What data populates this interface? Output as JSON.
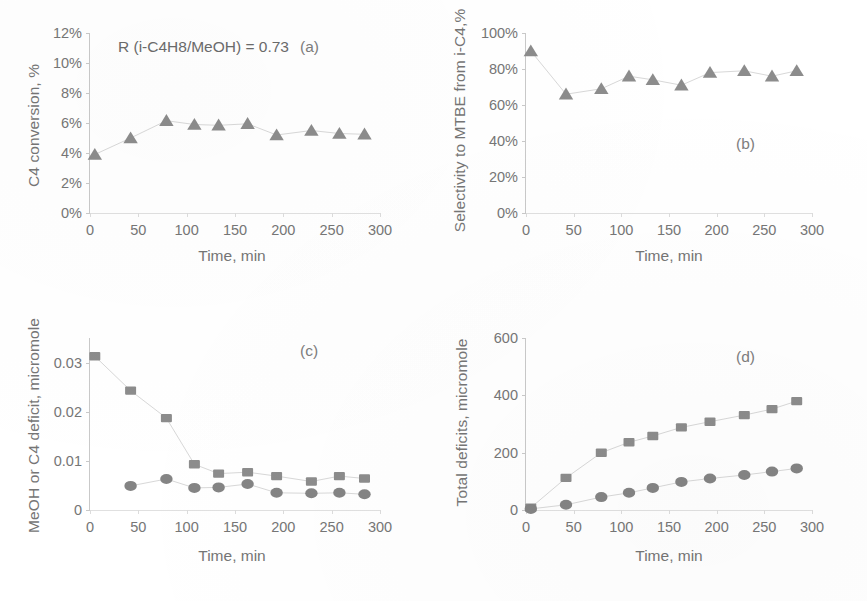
{
  "figure": {
    "background": "#ffffff",
    "marker_color": "#8c8c8c",
    "marker_color_dark": "#848484",
    "line_color": "#d8d8d8",
    "axis_color": "#c9c9c9",
    "text_color": "#757575"
  },
  "common": {
    "xlabel": "Time, min",
    "xticks": [
      "0",
      "50",
      "100",
      "150",
      "200",
      "250",
      "300"
    ],
    "xlim": [
      0,
      300
    ]
  },
  "panels": {
    "a": {
      "tag": "(a)",
      "ylabel": "C4 conversion, %",
      "annotation": "R (i-C4H8/MeOH) = 0.73",
      "yticks": [
        "0%",
        "2%",
        "4%",
        "6%",
        "8%",
        "10%",
        "12%"
      ]
    },
    "b": {
      "tag": "(b)",
      "ylabel": "Selectivity to MTBE from i-C4,%",
      "yticks": [
        "0%",
        "20%",
        "40%",
        "60%",
        "80%",
        "100%"
      ]
    },
    "c": {
      "tag": "(c)",
      "ylabel": "MeOH or C4 deficit, micromole",
      "yticks": [
        "0",
        "0.01",
        "0.02",
        "0.03"
      ]
    },
    "d": {
      "tag": "(d)",
      "ylabel": "Total deficits, micromole",
      "yticks": [
        "0",
        "200",
        "400",
        "600"
      ]
    }
  },
  "chart_data": [
    {
      "id": "a",
      "type": "scatter",
      "title": "(a)",
      "xlabel": "Time, min",
      "ylabel": "C4 conversion, %",
      "annotation": "R (i-C4H8/MeOH) = 0.73",
      "xlim": [
        0,
        300
      ],
      "ylim": [
        0,
        12
      ],
      "ytick_values": [
        0,
        2,
        4,
        6,
        8,
        10,
        12
      ],
      "ytick_labels": [
        "0%",
        "2%",
        "4%",
        "6%",
        "8%",
        "10%",
        "12%"
      ],
      "xtick_values": [
        0,
        50,
        100,
        150,
        200,
        250,
        300
      ],
      "grid": false,
      "legend": "none",
      "series": [
        {
          "name": "C4 conversion",
          "marker": "triangle",
          "color": "#8c8c8c",
          "x": [
            5,
            42,
            79,
            108,
            133,
            163,
            193,
            229,
            258,
            284
          ],
          "y": [
            3.9,
            5.0,
            6.15,
            5.9,
            5.85,
            5.95,
            5.2,
            5.5,
            5.3,
            5.25
          ]
        }
      ]
    },
    {
      "id": "b",
      "type": "scatter",
      "title": "(b)",
      "xlabel": "Time, min",
      "ylabel": "Selectivity to MTBE from i-C4,%",
      "xlim": [
        0,
        300
      ],
      "ylim": [
        0,
        100
      ],
      "ytick_values": [
        0,
        20,
        40,
        60,
        80,
        100
      ],
      "ytick_labels": [
        "0%",
        "20%",
        "40%",
        "60%",
        "80%",
        "100%"
      ],
      "xtick_values": [
        0,
        50,
        100,
        150,
        200,
        250,
        300
      ],
      "grid": false,
      "legend": "none",
      "series": [
        {
          "name": "Selectivity to MTBE",
          "marker": "triangle",
          "color": "#8c8c8c",
          "x": [
            5,
            42,
            79,
            108,
            133,
            163,
            193,
            229,
            258,
            284
          ],
          "y": [
            90,
            66,
            69,
            76,
            74,
            71,
            78,
            79,
            76,
            79
          ]
        }
      ]
    },
    {
      "id": "c",
      "type": "scatter",
      "title": "(c)",
      "xlabel": "Time, min",
      "ylabel": "MeOH or C4 deficit, micromole",
      "xlim": [
        0,
        300
      ],
      "ylim": [
        0,
        0.035
      ],
      "ytick_values": [
        0,
        0.01,
        0.02,
        0.03
      ],
      "ytick_labels": [
        "0",
        "0.01",
        "0.02",
        "0.03"
      ],
      "xtick_values": [
        0,
        50,
        100,
        150,
        200,
        250,
        300
      ],
      "grid": false,
      "legend": "none",
      "series": [
        {
          "name": "MeOH deficit",
          "marker": "square",
          "color": "#8c8c8c",
          "x": [
            5,
            42,
            79,
            108,
            133,
            163,
            193,
            229,
            258,
            284
          ],
          "y": [
            0.0313,
            0.0243,
            0.0187,
            0.0093,
            0.0074,
            0.0077,
            0.0069,
            0.0058,
            0.0069,
            0.0064
          ]
        },
        {
          "name": "C4 deficit",
          "marker": "circle",
          "color": "#848484",
          "x": [
            42,
            79,
            108,
            133,
            163,
            193,
            229,
            258,
            284
          ],
          "y": [
            0.0049,
            0.0063,
            0.0045,
            0.0046,
            0.0053,
            0.0035,
            0.0034,
            0.0035,
            0.0032
          ]
        }
      ]
    },
    {
      "id": "d",
      "type": "scatter",
      "title": "(d)",
      "xlabel": "Time, min",
      "ylabel": "Total deficits, micromole",
      "xlim": [
        0,
        300
      ],
      "ylim": [
        0,
        600
      ],
      "ytick_values": [
        0,
        200,
        400,
        600
      ],
      "ytick_labels": [
        "0",
        "200",
        "400",
        "600"
      ],
      "xtick_values": [
        0,
        50,
        100,
        150,
        200,
        250,
        300
      ],
      "grid": false,
      "legend": "none",
      "series": [
        {
          "name": "Total MeOH deficit",
          "marker": "square",
          "color": "#8c8c8c",
          "x": [
            5,
            42,
            79,
            108,
            133,
            163,
            193,
            229,
            258,
            284
          ],
          "y": [
            8,
            112,
            200,
            236,
            258,
            288,
            308,
            331,
            352,
            380
          ]
        },
        {
          "name": "Total C4 deficit",
          "marker": "circle",
          "color": "#848484",
          "x": [
            5,
            42,
            79,
            108,
            133,
            163,
            193,
            229,
            258,
            284
          ],
          "y": [
            4,
            18,
            45,
            60,
            77,
            98,
            110,
            122,
            134,
            145
          ]
        }
      ]
    }
  ]
}
